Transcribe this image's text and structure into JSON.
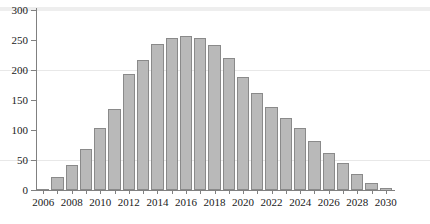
{
  "chart_data": {
    "type": "bar",
    "title": "",
    "subtitle": "",
    "xlabel": "",
    "ylabel": "",
    "xlim": [
      2005.5,
      2030.5
    ],
    "ylim": [
      0,
      300
    ],
    "grid": true,
    "gridlines_y": [
      50,
      200,
      300
    ],
    "legend": null,
    "bar_color": "#b9b9b9",
    "bar_edge_color": "#8a8a8a",
    "axis_color": "#808080",
    "y_ticks": [
      0,
      50,
      100,
      150,
      200,
      250,
      300
    ],
    "x_ticks": [
      2006,
      2007,
      2008,
      2009,
      2010,
      2011,
      2012,
      2013,
      2014,
      2015,
      2016,
      2017,
      2018,
      2019,
      2020,
      2021,
      2022,
      2023,
      2024,
      2025,
      2026,
      2027,
      2028,
      2029,
      2030
    ],
    "x_tick_labels": [
      "2006",
      "",
      "2008",
      "",
      "2010",
      "",
      "2012",
      "",
      "2014",
      "",
      "2016",
      "",
      "2018",
      "",
      "2020",
      "",
      "2022",
      "",
      "2024",
      "",
      "2026",
      "",
      "2028",
      "",
      "2030"
    ],
    "categories": [
      2006,
      2007,
      2008,
      2009,
      2010,
      2011,
      2012,
      2013,
      2014,
      2015,
      2016,
      2017,
      2018,
      2019,
      2020,
      2021,
      2022,
      2023,
      2024,
      2025,
      2026,
      2027,
      2028,
      2029,
      2030
    ],
    "values": [
      2,
      21,
      41,
      68,
      104,
      135,
      193,
      217,
      243,
      254,
      256,
      253,
      242,
      220,
      189,
      162,
      139,
      120,
      104,
      81,
      62,
      45,
      27,
      12,
      3
    ]
  }
}
